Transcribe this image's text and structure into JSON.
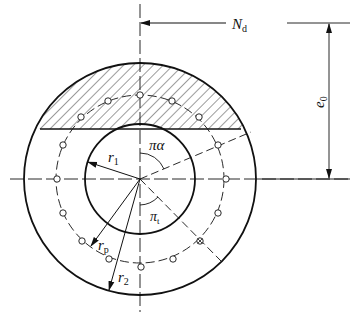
{
  "diagram": {
    "type": "cross-section",
    "labels": {
      "axial_force": "N",
      "axial_force_sub": "d",
      "eccentricity": "e",
      "eccentricity_sub": "0",
      "inner_radius": "r",
      "inner_radius_sub": "1",
      "outer_radius": "r",
      "outer_radius_sub": "2",
      "bar_circle_radius": "r",
      "bar_circle_radius_sub": "p",
      "compression_angle": "πα",
      "tension_angle": "π",
      "tension_angle_sub": "t"
    },
    "colors": {
      "stroke": "#111111",
      "background": "#ffffff"
    }
  }
}
